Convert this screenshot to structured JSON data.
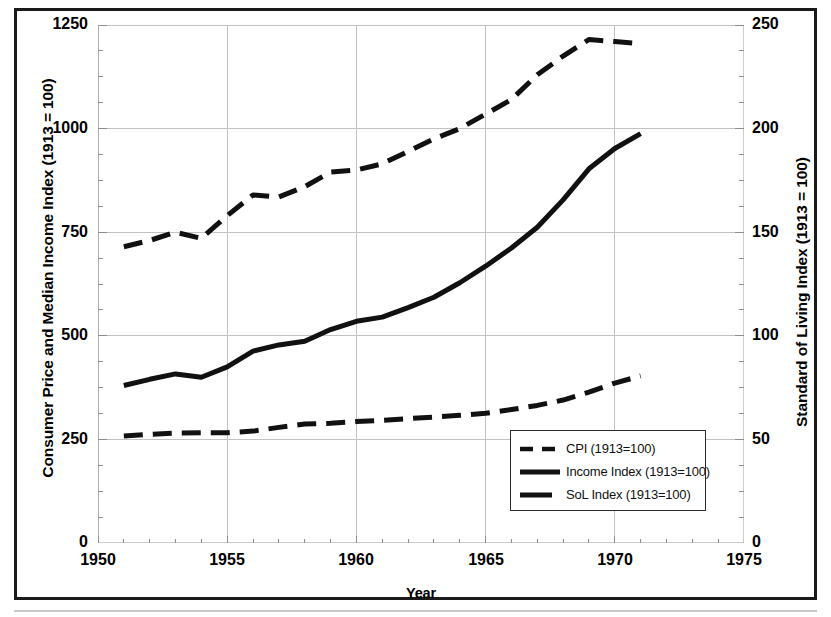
{
  "figure": {
    "x_axis": {
      "title": "Year",
      "ticks": [
        "1950",
        "1955",
        "1960",
        "1965",
        "1970",
        "1975"
      ],
      "min": 1950,
      "max": 1975,
      "minor_tick_interval": 1
    },
    "y_axis_left": {
      "title": "Consumer Price and Median Income Index (1913 = 100)",
      "ticks": [
        "0",
        "250",
        "500",
        "750",
        "1000",
        "1250"
      ],
      "min": 0,
      "max": 1250
    },
    "y_axis_right": {
      "title": "Standard of Living Index (1913 = 100)",
      "ticks": [
        "0",
        "50",
        "100",
        "150",
        "200",
        "250"
      ],
      "min": 0,
      "max": 250
    },
    "legend": {
      "items": [
        {
          "label": "CPI (1913=100)",
          "style": "dashed",
          "color": "#111111"
        },
        {
          "label": "Income Index (1913=100)",
          "style": "solid",
          "color": "#111111"
        },
        {
          "label": "SoL Index (1913=100)",
          "style": "solid-short",
          "color": "#111111"
        }
      ]
    }
  },
  "chart_data": {
    "type": "line",
    "title": "",
    "xlabel": "Year",
    "ylabel": "Consumer Price and Median Income Index (1913 = 100)",
    "y2label": "Standard of Living Index (1913 = 100)",
    "xlim": [
      1950,
      1975
    ],
    "ylim": [
      0,
      1250
    ],
    "y2lim": [
      0,
      250
    ],
    "grid": true,
    "legend_position": "lower-right-inside",
    "x": [
      1951,
      1952,
      1953,
      1954,
      1955,
      1956,
      1957,
      1958,
      1959,
      1960,
      1961,
      1962,
      1963,
      1964,
      1965,
      1966,
      1967,
      1968,
      1969,
      1970,
      1971
    ],
    "series": [
      {
        "name": "SoL Index (1913=100)",
        "axis": "right",
        "style": "dashed",
        "values": [
          143,
          146,
          150,
          147,
          158,
          168,
          167,
          172,
          179,
          180,
          183,
          189,
          195,
          200,
          207,
          214,
          226,
          235,
          243,
          242,
          241
        ]
      },
      {
        "name": "Income Index (1913=100)",
        "axis": "left",
        "style": "solid",
        "values": [
          380,
          395,
          408,
          400,
          425,
          463,
          478,
          487,
          515,
          535,
          545,
          568,
          593,
          628,
          668,
          712,
          762,
          828,
          903,
          952,
          988
        ]
      },
      {
        "name": "CPI (1913=100)",
        "axis": "left",
        "style": "dashed",
        "values": [
          258,
          262,
          265,
          266,
          266,
          270,
          279,
          287,
          289,
          293,
          296,
          300,
          304,
          308,
          313,
          322,
          332,
          345,
          364,
          386,
          403
        ]
      }
    ]
  }
}
